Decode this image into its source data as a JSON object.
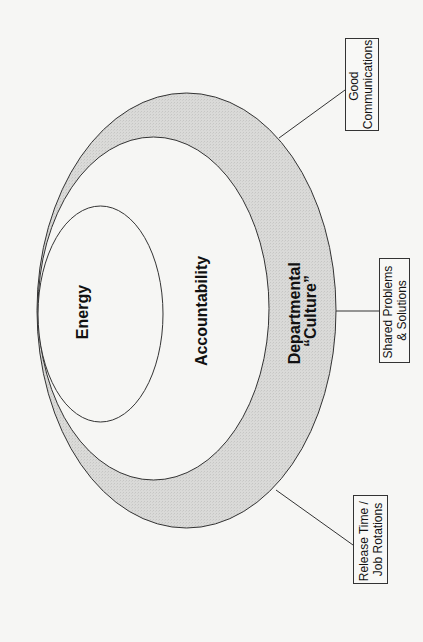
{
  "diagram": {
    "type": "nested-ellipses",
    "rings": [
      {
        "id": "outer",
        "label_lines": [
          "Departmental",
          "“Culture”"
        ],
        "fill": "#d9d9d7"
      },
      {
        "id": "middle",
        "label_lines": [
          "Accountability"
        ],
        "fill": "#f6f6f4"
      },
      {
        "id": "inner",
        "label_lines": [
          "Energy"
        ],
        "fill": "#f6f6f4"
      }
    ],
    "callouts": [
      {
        "id": "good-communications",
        "label_lines": [
          "Good",
          "Communications"
        ]
      },
      {
        "id": "shared-problems",
        "label_lines": [
          "Shared Problems",
          "& Solutions"
        ]
      },
      {
        "id": "release-time",
        "label_lines": [
          "Release Time /",
          "Job Rotations"
        ]
      }
    ],
    "colors": {
      "background": "#f6f6f4",
      "outer_fill": "#d9d9d7",
      "stroke": "#333333"
    }
  }
}
